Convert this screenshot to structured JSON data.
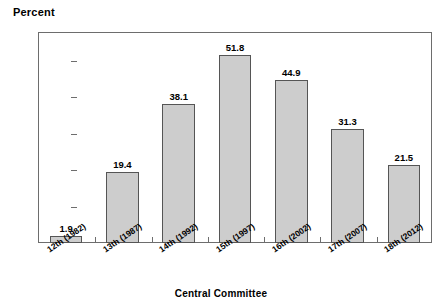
{
  "chart_data": {
    "type": "bar",
    "title": "",
    "xlabel": "Central Committee",
    "ylabel": "Percent",
    "categories": [
      "12th (1982)",
      "13th (1987)",
      "14th (1992)",
      "15th (1997)",
      "16th (2002)",
      "17th (2007)",
      "18th (2012)"
    ],
    "values": [
      1.9,
      19.4,
      38.1,
      51.8,
      44.9,
      31.3,
      21.5
    ],
    "value_labels": [
      "1.9",
      "19.4",
      "38.1",
      "51.8",
      "44.9",
      "31.3",
      "21.5"
    ],
    "ytick_labels": [
      "10.0",
      "20.0",
      "30.0",
      "40.0",
      "50.0"
    ],
    "ytick_values": [
      10,
      20,
      30,
      40,
      50
    ],
    "ylim": [
      0,
      58
    ],
    "grid": false,
    "legend": false,
    "bar_color": "#cdcdcd",
    "bar_border_color": "#555555",
    "axis_color": "#6d6d6d",
    "text_color": "#000000"
  }
}
